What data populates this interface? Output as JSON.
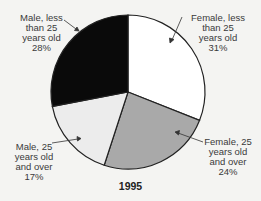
{
  "chart_data": {
    "type": "pie",
    "title": "1995",
    "slices": [
      {
        "label": "Female, less than 25 years old",
        "value": 31,
        "color": "#ffffff"
      },
      {
        "label": "Female, 25 years old and over",
        "value": 24,
        "color": "#a9a9a9"
      },
      {
        "label": "Male, 25 years old and over",
        "value": 17,
        "color": "#ececec"
      },
      {
        "label": "Male, less than 25 years old",
        "value": 28,
        "color": "#0a0a0a"
      }
    ],
    "start_angle": "12 o'clock",
    "direction": "clockwise"
  },
  "labels": {
    "female_lt25": {
      "l1": "Female, less",
      "l2": "than 25",
      "l3": "years old",
      "pct": "31%"
    },
    "female_25plus": {
      "l1": "Female, 25",
      "l2": "years old",
      "l3": "and over",
      "pct": "24%"
    },
    "male_25plus": {
      "l1": "Male, 25",
      "l2": "years old",
      "l3": "and over",
      "pct": "17%"
    },
    "male_lt25": {
      "l1": "Male, less",
      "l2": "than 25",
      "l3": "years old",
      "pct": "28%"
    }
  },
  "title": "1995"
}
